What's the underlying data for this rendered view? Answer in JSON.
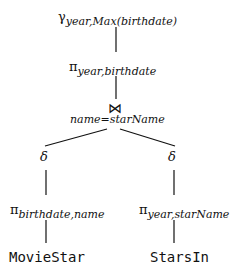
{
  "tree": {
    "root": {
      "op": "γ",
      "subscript": "year,Max(birthdate)"
    },
    "proj_top": {
      "op": "π",
      "subscript": "year,birthdate"
    },
    "join": {
      "op": "⋈",
      "condition": "name=starName"
    },
    "left_delta": {
      "op": "δ"
    },
    "right_delta": {
      "op": "δ"
    },
    "left_proj": {
      "op": "π",
      "subscript": "birthdate,name"
    },
    "right_proj": {
      "op": "π",
      "subscript": "year,starName"
    },
    "left_relation": {
      "name": "MovieStar"
    },
    "right_relation": {
      "name": "StarsIn"
    }
  }
}
